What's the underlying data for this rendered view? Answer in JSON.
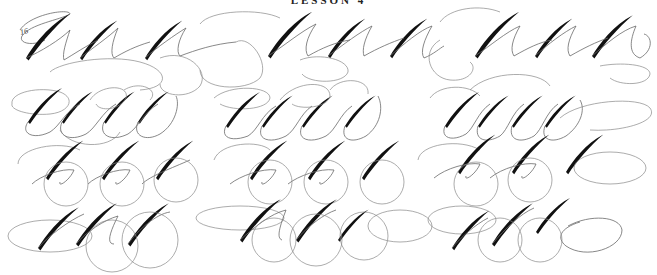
{
  "sheet": {
    "caption": "LESSON 4",
    "page_mark": "16",
    "background": "#ffffff",
    "ink_color": "#111111",
    "hairline_color": "#6a6a6a"
  },
  "grid": {
    "columns": 3,
    "rows": [
      {
        "row": 1,
        "letters": [
          "A",
          "A",
          "A"
        ],
        "description": "Flourished capital A, three per group"
      },
      {
        "row": 2,
        "letters": [
          "E",
          "E",
          "E"
        ],
        "description": "Flourished capital E, four strokes per group"
      },
      {
        "row": 3,
        "letters": [
          "D",
          "L",
          "C"
        ],
        "description": "Looped D / L / C capitals with oval flourishes"
      },
      {
        "row": 4,
        "letters": [
          "A",
          "C",
          "A"
        ],
        "description": "Capital strokes with large oval flourishes"
      }
    ]
  }
}
